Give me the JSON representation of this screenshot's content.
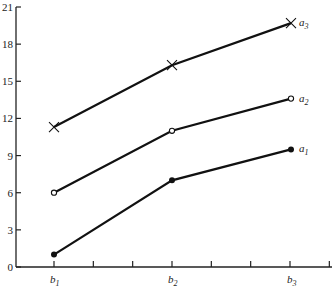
{
  "chart_data": {
    "type": "line",
    "title": "",
    "xlabel": "",
    "ylabel": "",
    "categories": [
      "b1",
      "b2",
      "b3"
    ],
    "category_labels": [
      {
        "base": "b",
        "sub": "1"
      },
      {
        "base": "b",
        "sub": "2"
      },
      {
        "base": "b",
        "sub": "3"
      }
    ],
    "ylim": [
      0,
      21
    ],
    "yticks": [
      0,
      3,
      6,
      9,
      12,
      15,
      18,
      21
    ],
    "grid": false,
    "legend": "inline labels at line ends",
    "series": [
      {
        "name": "a3",
        "label_base": "a",
        "label_sub": "3",
        "marker": "x",
        "values": [
          11.3,
          16.3,
          19.7
        ]
      },
      {
        "name": "a2",
        "label_base": "a",
        "label_sub": "2",
        "marker": "open-circle",
        "values": [
          6,
          11,
          13.6
        ]
      },
      {
        "name": "a1",
        "label_base": "a",
        "label_sub": "1",
        "marker": "filled-circle",
        "values": [
          1,
          7,
          9.5
        ]
      }
    ]
  }
}
